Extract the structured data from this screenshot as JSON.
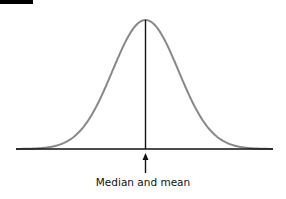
{
  "diagram": {
    "type": "normal-distribution",
    "label": "Median and mean",
    "colors": {
      "curve": "#888888",
      "axis": "#111111",
      "arrow": "#111111"
    }
  }
}
